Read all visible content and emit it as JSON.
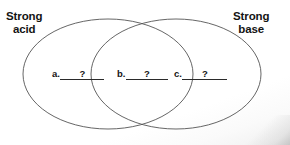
{
  "diagram": {
    "type": "venn-two-set",
    "left_set": {
      "label_line1": "Strong",
      "label_line2": "acid"
    },
    "right_set": {
      "label_line1": "Strong",
      "label_line2": "base"
    },
    "blanks": [
      {
        "key": "a.",
        "value": "?",
        "region": "left-only"
      },
      {
        "key": "b.",
        "value": "?",
        "region": "intersection"
      },
      {
        "key": "c.",
        "value": "?",
        "region": "right-only"
      }
    ],
    "stroke_color": "#555555",
    "text_color": "#141414",
    "background_color": "#ffffff"
  }
}
